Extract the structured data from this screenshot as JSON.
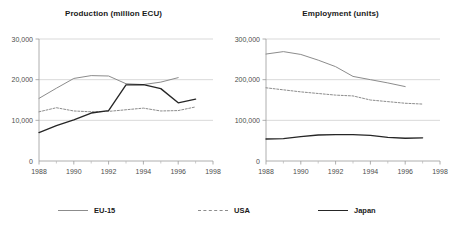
{
  "legend": {
    "items": [
      {
        "label": "EU-15",
        "style": "solid",
        "color": "#8c8c8c",
        "swatch": "sw-solid-gray"
      },
      {
        "label": "USA",
        "style": "dashed",
        "color": "#8c8c8c",
        "swatch": "sw-dashed-gray"
      },
      {
        "label": "Japan",
        "style": "solid",
        "color": "#262626",
        "swatch": "sw-solid-black"
      }
    ]
  },
  "chart_data": [
    {
      "type": "line",
      "title": "Production (million ECU)",
      "xlabel": "",
      "ylabel": "",
      "xlim": [
        1988,
        1998
      ],
      "ylim": [
        0,
        30000
      ],
      "yticks": [
        0,
        10000,
        20000,
        30000
      ],
      "ytick_labels": [
        "0",
        "10,000",
        "20,000",
        "30,000"
      ],
      "xticks": [
        1988,
        1990,
        1992,
        1994,
        1996,
        1998
      ],
      "xtick_labels": [
        "1988",
        "1990",
        "1992",
        "1994",
        "1996",
        "1998"
      ],
      "xminor_ticks": [
        1989,
        1991,
        1993,
        1995,
        1997
      ],
      "grid": "horizontal",
      "legend_position": "below-figure",
      "series": [
        {
          "name": "EU-15",
          "color": "#8c8c8c",
          "style": "solid",
          "x": [
            1988,
            1989,
            1990,
            1991,
            1992,
            1993,
            1994,
            1995,
            1996
          ],
          "values": [
            15400,
            17900,
            20300,
            21000,
            20900,
            19000,
            18800,
            19400,
            20500
          ]
        },
        {
          "name": "USA",
          "color": "#8c8c8c",
          "style": "dashed",
          "x": [
            1988,
            1989,
            1990,
            1991,
            1992,
            1993,
            1994,
            1995,
            1996,
            1997
          ],
          "values": [
            12100,
            13100,
            12300,
            12100,
            12200,
            12600,
            13000,
            12300,
            12400,
            13300
          ]
        },
        {
          "name": "Japan",
          "color": "#262626",
          "style": "solid",
          "x": [
            1988,
            1989,
            1990,
            1991,
            1992,
            1993,
            1994,
            1995,
            1996,
            1997
          ],
          "values": [
            7000,
            8700,
            10100,
            11800,
            12400,
            18700,
            18800,
            17800,
            14300,
            15200
          ]
        }
      ]
    },
    {
      "type": "line",
      "title": "Employment (units)",
      "xlabel": "",
      "ylabel": "",
      "xlim": [
        1988,
        1998
      ],
      "ylim": [
        0,
        300000
      ],
      "yticks": [
        0,
        100000,
        200000,
        300000
      ],
      "ytick_labels": [
        "0",
        "100,000",
        "200,000",
        "300,000"
      ],
      "xticks": [
        1988,
        1990,
        1992,
        1994,
        1996,
        1998
      ],
      "xtick_labels": [
        "1988",
        "1990",
        "1992",
        "1994",
        "1996",
        "1998"
      ],
      "xminor_ticks": [
        1989,
        1991,
        1993,
        1995,
        1997
      ],
      "grid": "horizontal",
      "legend_position": "below-figure",
      "series": [
        {
          "name": "EU-15",
          "color": "#8c8c8c",
          "style": "solid",
          "x": [
            1988,
            1989,
            1990,
            1991,
            1992,
            1993,
            1994,
            1995,
            1996
          ],
          "values": [
            263000,
            269000,
            262000,
            248000,
            232000,
            208000,
            200000,
            192000,
            183000
          ]
        },
        {
          "name": "USA",
          "color": "#8c8c8c",
          "style": "dashed",
          "x": [
            1988,
            1989,
            1990,
            1991,
            1992,
            1993,
            1994,
            1995,
            1996,
            1997
          ],
          "values": [
            180000,
            175000,
            170000,
            166000,
            162000,
            160000,
            150000,
            146000,
            142000,
            140000
          ]
        },
        {
          "name": "Japan",
          "color": "#262626",
          "style": "solid",
          "x": [
            1988,
            1989,
            1990,
            1991,
            1992,
            1993,
            1994,
            1995,
            1996,
            1997
          ],
          "values": [
            54000,
            55000,
            60000,
            64000,
            65000,
            65000,
            63000,
            58000,
            56000,
            57000
          ]
        }
      ]
    }
  ]
}
